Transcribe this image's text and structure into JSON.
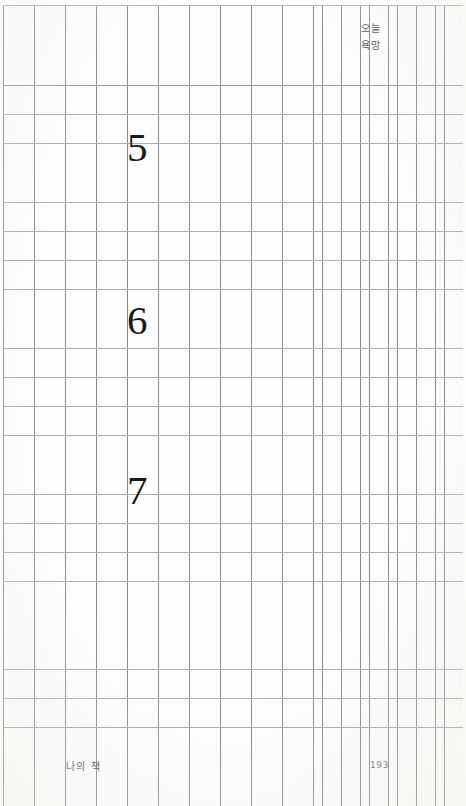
{
  "page": {
    "width": 466,
    "height": 806,
    "paper_color": "#fdfdfd",
    "grid_line_color": "#8e8e8e",
    "rule_line_color": "#aeaeae",
    "ink_color": "#1a1a1a"
  },
  "header": {
    "note_lines": [
      "오늘",
      "욕망"
    ]
  },
  "body": {
    "numerals": [
      {
        "label": "5"
      },
      {
        "label": "6"
      },
      {
        "label": "7"
      }
    ]
  },
  "footer": {
    "caption": "나의 책",
    "page_number": "193"
  }
}
